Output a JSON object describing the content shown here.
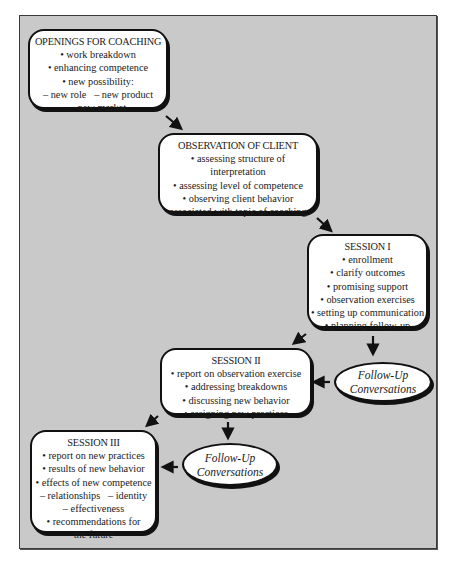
{
  "diagram": {
    "nodes": {
      "openings": {
        "title": "OPENINGS FOR COACHING",
        "lines": [
          "• work breakdown",
          "• enhancing competence",
          "• new possibility:",
          "– new role   – new product",
          "– new market"
        ]
      },
      "observation": {
        "title": "OBSERVATION OF CLIENT",
        "lines": [
          "• assessing structure of",
          "interpretation",
          "• assessing level of competence",
          "• observing client behavior",
          "associated with topic of coaching"
        ]
      },
      "session1": {
        "title": "SESSION I",
        "lines": [
          "• enrollment",
          "• clarify outcomes",
          "• promising support",
          "• observation exercises",
          "• setting up communication",
          "• planning follow-up"
        ]
      },
      "followup1": {
        "lines": [
          "Follow-Up",
          "Conversations"
        ]
      },
      "session2": {
        "title": "SESSION II",
        "lines": [
          "• report on observation exercise",
          "• addressing breakdowns",
          "• discussing new behavior",
          "• assigning new practices"
        ]
      },
      "followup2": {
        "lines": [
          "Follow-Up",
          "Conversations"
        ]
      },
      "session3": {
        "title": "SESSION III",
        "lines": [
          "• report on new practices",
          "• results of new behavior",
          "• effects of new competence",
          "– relationships   – identity",
          "– effectiveness",
          "• recommendations for",
          "the future"
        ]
      }
    },
    "edges": [
      {
        "from": "openings",
        "to": "observation"
      },
      {
        "from": "observation",
        "to": "session1"
      },
      {
        "from": "session1",
        "to": "followup1"
      },
      {
        "from": "session1",
        "to": "session2"
      },
      {
        "from": "followup1",
        "to": "session2"
      },
      {
        "from": "session2",
        "to": "followup2"
      },
      {
        "from": "session2",
        "to": "session3"
      },
      {
        "from": "followup2",
        "to": "session3"
      }
    ],
    "colors": {
      "background": "#c9c9c9",
      "box_fill": "#ffffff",
      "border": "#111111"
    }
  }
}
